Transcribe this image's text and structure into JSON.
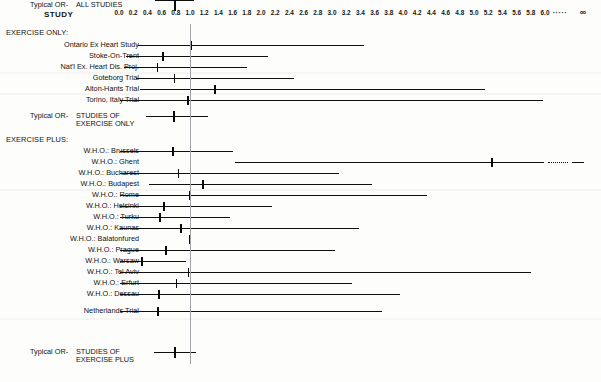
{
  "header": {
    "study_column_title": "STUDY"
  },
  "axis": {
    "ticks": [
      "0.0",
      "0.2",
      "0.4",
      "0.6",
      "0.8",
      "1.0",
      "1.2",
      "1.4",
      "1.6",
      "1.8",
      "2.0",
      "2.2",
      "2.4",
      "2.6",
      "2.8",
      "3.0",
      "3.2",
      "3.4",
      "3.6",
      "3.8",
      "4.0",
      "4.2",
      "4.4",
      "4.6",
      "4.8",
      "5.0",
      "5.2",
      "5.4",
      "5.6",
      "5.8",
      "6.0"
    ],
    "break_marker": "·····",
    "infinity_label": "∞",
    "null_value": 1.0,
    "min": 0.0,
    "max": 6.0
  },
  "sections": [
    {
      "id": "exercise-only",
      "label": "EXERCISE ONLY:"
    },
    {
      "id": "exercise-plus",
      "label": "EXERCISE PLUS:"
    }
  ],
  "summaries": [
    {
      "id": "typical-or-exercise-only",
      "prefix": "Typical OR-",
      "line1": "STUDIES OF",
      "line2": "EXERCISE ONLY"
    },
    {
      "id": "typical-or-exercise-plus",
      "prefix": "Typical OR-",
      "line1": "STUDIES OF",
      "line2": "EXERCISE PLUS"
    },
    {
      "id": "typical-or-all-studies",
      "prefix": "Typical OR-",
      "line1": "ALL STUDIES",
      "line2": ""
    }
  ],
  "chart_data": {
    "type": "forest",
    "title": "",
    "xlabel": "",
    "ylabel": "STUDY",
    "xlim": [
      0.0,
      6.0
    ],
    "null_line": 1.0,
    "grid": false,
    "legend": "none",
    "rows": [
      {
        "kind": "section",
        "label": "EXERCISE ONLY:"
      },
      {
        "kind": "study",
        "label": "Ontario Ex Heart Study",
        "or": 1.02,
        "low": 0.27,
        "high": 3.45,
        "truncated": false
      },
      {
        "kind": "study",
        "label": "Stoke-On-Trent",
        "or": 0.62,
        "low": 0.1,
        "high": 2.1,
        "truncated": false
      },
      {
        "kind": "study",
        "label": "Nat'l Ex. Heart Dis. Proj.",
        "or": 0.54,
        "low": 0.07,
        "high": 1.8,
        "truncated": false
      },
      {
        "kind": "study",
        "label": "Goteborg Trial",
        "or": 0.78,
        "low": 0.24,
        "high": 2.47,
        "truncated": false
      },
      {
        "kind": "study",
        "label": "Alton-Hants Trial",
        "or": 1.35,
        "low": 0.3,
        "high": 5.15,
        "truncated": false
      },
      {
        "kind": "study",
        "label": "Torino, Italy Trial",
        "or": 0.97,
        "low": 0.02,
        "high": 5.97,
        "truncated": false
      },
      {
        "kind": "summary",
        "label": "Typical OR- STUDIES OF EXERCISE ONLY",
        "or": 0.77,
        "low": 0.38,
        "high": 1.25,
        "truncated": false
      },
      {
        "kind": "section",
        "label": "EXERCISE PLUS:"
      },
      {
        "kind": "study",
        "label": "W.H.O.: Brussels",
        "or": 0.76,
        "low": 0.02,
        "high": 1.61,
        "truncated": false
      },
      {
        "kind": "study",
        "label": "W.H.O.: Ghent",
        "or": 5.25,
        "low": 1.63,
        "high": 99.0,
        "truncated": true
      },
      {
        "kind": "study",
        "label": "W.H.O.: Bucharest",
        "or": 0.84,
        "low": 0.02,
        "high": 3.1,
        "truncated": false
      },
      {
        "kind": "study",
        "label": "W.H.O.: Budapest",
        "or": 1.18,
        "low": 0.42,
        "high": 3.57,
        "truncated": false
      },
      {
        "kind": "study",
        "label": "W.H.O.: Rome",
        "or": 1.0,
        "low": 0.02,
        "high": 4.34,
        "truncated": false
      },
      {
        "kind": "study",
        "label": "W.H.O.: Helsinki",
        "or": 0.63,
        "low": 0.02,
        "high": 2.16,
        "truncated": false
      },
      {
        "kind": "study",
        "label": "W.H.O.: Turku",
        "or": 0.58,
        "low": 0.02,
        "high": 1.56,
        "truncated": false
      },
      {
        "kind": "study",
        "label": "W.H.O.: Kaunas",
        "or": 0.87,
        "low": 0.02,
        "high": 3.38,
        "truncated": false
      },
      {
        "kind": "study",
        "label": "W.H.O.: Balatonfured",
        "or": 1.0,
        "low": 1.0,
        "high": 1.0,
        "truncated": false
      },
      {
        "kind": "study",
        "label": "W.H.O.: Prague",
        "or": 0.66,
        "low": 0.02,
        "high": 3.04,
        "truncated": false
      },
      {
        "kind": "study",
        "label": "W.H.O.: Warsaw",
        "or": 0.32,
        "low": 0.02,
        "high": 0.94,
        "truncated": false
      },
      {
        "kind": "study",
        "label": "W.H.O.: Tel Aviv",
        "or": 0.98,
        "low": 0.02,
        "high": 5.8,
        "truncated": false
      },
      {
        "kind": "study",
        "label": "W.H.O.: Erfurt",
        "or": 0.81,
        "low": 0.02,
        "high": 3.28,
        "truncated": false
      },
      {
        "kind": "study",
        "label": "W.H.O.: Dessau",
        "or": 0.56,
        "low": 0.02,
        "high": 3.96,
        "truncated": false
      },
      {
        "kind": "study",
        "label": "Netherlands Trial",
        "or": 0.55,
        "low": 0.02,
        "high": 3.7,
        "truncated": false
      },
      {
        "kind": "summary",
        "label": "Typical OR- STUDIES OF EXERCISE PLUS",
        "or": 0.78,
        "low": 0.49,
        "high": 1.08,
        "truncated": false
      },
      {
        "kind": "summary",
        "label": "Typical OR- ALL STUDIES",
        "or": 0.78,
        "low": 0.5,
        "high": 1.06,
        "truncated": false
      }
    ]
  }
}
